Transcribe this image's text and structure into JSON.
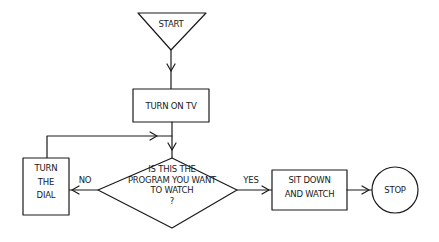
{
  "flowchart": {
    "nodes": {
      "start": {
        "label": "START",
        "shape": "inverted-triangle"
      },
      "turn_on_tv": {
        "label": "TURN ON TV",
        "shape": "rectangle"
      },
      "decision": {
        "label": "IS THIS THE\nPROGRAM YOU WANT\nTO WATCH\n?",
        "shape": "diamond"
      },
      "turn_dial": {
        "label": "TURN\nTHE\nDIAL",
        "shape": "rectangle"
      },
      "sit_down": {
        "label": "SIT DOWN\nAND WATCH",
        "shape": "rectangle"
      },
      "stop": {
        "label": "STOP",
        "shape": "circle"
      }
    },
    "edges": {
      "no_label": "NO",
      "yes_label": "YES"
    },
    "colors": {
      "ink": "#1a1a1a",
      "background": "#ffffff"
    }
  }
}
